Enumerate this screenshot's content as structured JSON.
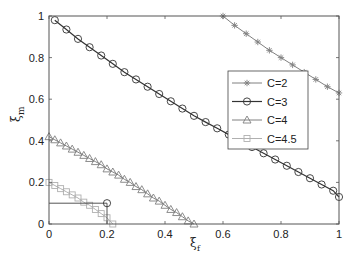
{
  "chart_data": {
    "type": "line",
    "title": "",
    "xlabel": "ξf",
    "ylabel": "ξm",
    "xlim": [
      0,
      1
    ],
    "ylim": [
      0,
      1
    ],
    "xticks": [
      0,
      0.2,
      0.4,
      0.6,
      0.8,
      1
    ],
    "xtick_labels": [
      "0",
      "0.2",
      "0.4",
      "0.6",
      "0.8",
      "1"
    ],
    "yticks": [
      0,
      0.2,
      0.4,
      0.6,
      0.8,
      1
    ],
    "ytick_labels": [
      "0",
      "0.2",
      "0.4",
      "0.6",
      "0.8",
      "1"
    ],
    "grid": false,
    "legend_position": "right-center",
    "series": [
      {
        "name": "C=2",
        "marker": "star",
        "color": "#808080",
        "x": [
          0.6,
          0.64,
          0.68,
          0.72,
          0.76,
          0.8,
          0.84,
          0.88,
          0.92,
          0.96,
          1.0
        ],
        "y": [
          1.0,
          0.955,
          0.915,
          0.875,
          0.835,
          0.8,
          0.765,
          0.73,
          0.695,
          0.66,
          0.63
        ]
      },
      {
        "name": "C=3",
        "marker": "circle",
        "color": "#333333",
        "x": [
          0.02,
          0.06,
          0.1,
          0.14,
          0.18,
          0.22,
          0.26,
          0.3,
          0.34,
          0.38,
          0.42,
          0.46,
          0.5,
          0.54,
          0.58,
          0.62,
          0.66,
          0.7,
          0.74,
          0.78,
          0.82,
          0.86,
          0.9,
          0.94,
          0.98,
          1.0
        ],
        "y": [
          0.98,
          0.935,
          0.89,
          0.85,
          0.81,
          0.77,
          0.73,
          0.695,
          0.66,
          0.625,
          0.59,
          0.555,
          0.52,
          0.49,
          0.46,
          0.43,
          0.4,
          0.37,
          0.34,
          0.31,
          0.28,
          0.25,
          0.22,
          0.19,
          0.16,
          0.13
        ]
      },
      {
        "name": "C=4",
        "marker": "triangle",
        "color": "#808080",
        "x": [
          0,
          0.02,
          0.04,
          0.06,
          0.08,
          0.1,
          0.12,
          0.14,
          0.16,
          0.18,
          0.2,
          0.22,
          0.24,
          0.26,
          0.28,
          0.3,
          0.32,
          0.34,
          0.36,
          0.38,
          0.4,
          0.42,
          0.44,
          0.46,
          0.48,
          0.5
        ],
        "y": [
          0.42,
          0.405,
          0.39,
          0.375,
          0.36,
          0.345,
          0.33,
          0.315,
          0.3,
          0.285,
          0.265,
          0.25,
          0.235,
          0.215,
          0.2,
          0.18,
          0.165,
          0.145,
          0.125,
          0.11,
          0.09,
          0.07,
          0.055,
          0.035,
          0.015,
          0.0
        ]
      },
      {
        "name": "C=4.5",
        "marker": "square",
        "color": "#b0b0b0",
        "x": [
          0,
          0.02,
          0.04,
          0.06,
          0.08,
          0.1,
          0.12,
          0.14,
          0.16,
          0.18,
          0.2,
          0.22
        ],
        "y": [
          0.2,
          0.185,
          0.17,
          0.155,
          0.14,
          0.125,
          0.105,
          0.09,
          0.07,
          0.05,
          0.03,
          0.0
        ]
      }
    ],
    "annotations": [
      {
        "type": "hline",
        "y": 0.1,
        "x0": 0,
        "x1": 0.2,
        "color": "#555555"
      },
      {
        "type": "vline",
        "x": 0.2,
        "y0": 0,
        "y1": 0.1,
        "color": "#555555"
      },
      {
        "type": "circle-marker",
        "x": 0.2,
        "y": 0.1,
        "color": "#333333"
      }
    ]
  },
  "legend": {
    "entries": [
      "C=2",
      "C=3",
      "C=4",
      "C=4.5"
    ]
  },
  "axes": {
    "xlabel_main": "ξ",
    "xlabel_sub": "f",
    "ylabel_main": "ξ",
    "ylabel_sub": "m"
  }
}
